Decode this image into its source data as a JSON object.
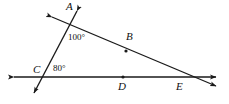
{
  "figure": {
    "background_color": "#ffffff",
    "stroke_color": "#1a1a1a",
    "points": [
      {
        "id": "A",
        "label": "A",
        "x": 70,
        "y": 18,
        "role": "intersection-transversal-line-AE"
      },
      {
        "id": "B",
        "label": "B",
        "x": 126,
        "y": 45,
        "role": "point-on-line-AE"
      },
      {
        "id": "C",
        "label": "C",
        "x": 45,
        "y": 77,
        "role": "intersection-transversal-horizontal"
      },
      {
        "id": "D",
        "label": "D",
        "x": 123,
        "y": 77,
        "role": "point-on-horizontal-line"
      },
      {
        "id": "E",
        "label": "E",
        "x": 177,
        "y": 77,
        "role": "intersection-line-AE-horizontal"
      }
    ],
    "angles": [
      {
        "id": "angle-100",
        "label": "100°",
        "value": 100,
        "unit": "degrees",
        "vertex": "A"
      },
      {
        "id": "angle-80",
        "label": "80°",
        "value": 80,
        "unit": "degrees",
        "vertex": "C"
      }
    ],
    "lines": [
      {
        "id": "horizontal-line",
        "name": "line-CDE",
        "from": {
          "x": 8,
          "y": 77
        },
        "to": {
          "x": 222,
          "y": 77
        },
        "arrows": "both",
        "passes_through": [
          "C",
          "D",
          "E"
        ]
      },
      {
        "id": "line-AE",
        "name": "line-ABE",
        "from": {
          "x": 47,
          "y": 15
        },
        "to": {
          "x": 222,
          "y": 89
        },
        "arrows": "both",
        "passes_through": [
          "A",
          "B",
          "E"
        ]
      },
      {
        "id": "transversal-line",
        "name": "line-AC",
        "from": {
          "x": 79,
          "y": 7
        },
        "to": {
          "x": 31,
          "y": 98
        },
        "arrows": "both",
        "passes_through": [
          "A",
          "C"
        ]
      }
    ],
    "dots": [
      {
        "id": "dot-B",
        "x": 126,
        "y": 51
      },
      {
        "id": "dot-D",
        "x": 123,
        "y": 77
      }
    ]
  }
}
